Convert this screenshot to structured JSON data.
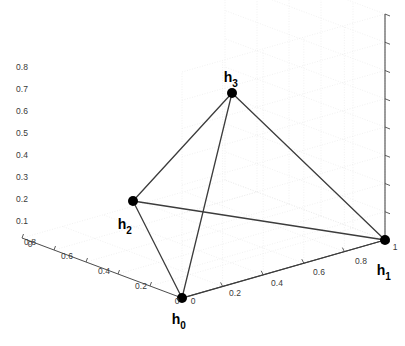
{
  "figure": {
    "background_color": "#ffffff",
    "axis_color": "#4d4d4d",
    "grid_color": "#e8e8e8",
    "edge_color": "#3c3c3c",
    "node_color": "#000000",
    "tick_text_color": "#3a3a3a",
    "label_text_color": "#000000"
  },
  "chart_data": {
    "type": "scatter",
    "title": "",
    "xlabel": "",
    "ylabel": "",
    "zlabel": "",
    "xlim": [
      0,
      1
    ],
    "ylim": [
      0,
      1
    ],
    "zlim": [
      0,
      0.8
    ],
    "grid": true,
    "legend": "none",
    "projection": "3d",
    "axes": [
      {
        "name": "x-axis",
        "orientation": "front-left",
        "ticks": [
          0,
          0.2,
          0.4,
          0.6,
          0.8
        ],
        "tick_labels": [
          "0",
          "0.2",
          "0.4",
          "0.6",
          "0.8"
        ]
      },
      {
        "name": "y-axis",
        "orientation": "front-right",
        "ticks": [
          0,
          0.2,
          0.4,
          0.6,
          0.8,
          1
        ],
        "tick_labels": [
          "0",
          "0.2",
          "0.4",
          "0.6",
          "0.8",
          "1"
        ]
      },
      {
        "name": "z-axis",
        "orientation": "vertical-left",
        "ticks": [
          0,
          0.1,
          0.2,
          0.3,
          0.4,
          0.5,
          0.6,
          0.7,
          0.8
        ],
        "tick_labels": [
          "0",
          "0.1",
          "0.2",
          "0.3",
          "0.4",
          "0.5",
          "0.6",
          "0.7",
          "0.8"
        ]
      }
    ],
    "points": [
      {
        "id": "h0",
        "label": "h",
        "subscript": "0",
        "px": 182,
        "py": 298,
        "label_px": 176,
        "label_py": 324
      },
      {
        "id": "h1",
        "label": "h",
        "subscript": "1",
        "px": 385,
        "py": 240,
        "label_px": 381,
        "label_py": 275
      },
      {
        "id": "h2",
        "label": "h",
        "subscript": "2",
        "px": 133,
        "py": 201,
        "label_px": 122,
        "label_py": 229
      },
      {
        "id": "h3",
        "label": "h",
        "subscript": "3",
        "px": 232,
        "py": 93,
        "label_px": 228,
        "label_py": 82
      }
    ],
    "edges": [
      {
        "from": "h0",
        "to": "h1"
      },
      {
        "from": "h0",
        "to": "h2"
      },
      {
        "from": "h0",
        "to": "h3"
      },
      {
        "from": "h1",
        "to": "h2"
      },
      {
        "from": "h1",
        "to": "h3"
      },
      {
        "from": "h2",
        "to": "h3"
      }
    ],
    "z_tick_labels": [
      {
        "text": "0.8",
        "x": 22,
        "y": 70
      },
      {
        "text": "0.7",
        "x": 22,
        "y": 92
      },
      {
        "text": "0.6",
        "x": 22,
        "y": 114
      },
      {
        "text": "0.5",
        "x": 22,
        "y": 136
      },
      {
        "text": "0.4",
        "x": 22,
        "y": 158
      },
      {
        "text": "0.3",
        "x": 22,
        "y": 180
      },
      {
        "text": "0.2",
        "x": 22,
        "y": 202
      },
      {
        "text": "0.1",
        "x": 22,
        "y": 224
      },
      {
        "text": "0",
        "x": 30,
        "y": 247
      }
    ],
    "x_tick_labels": [
      {
        "text": "0.8",
        "x": 30,
        "y": 245
      },
      {
        "text": "0.6",
        "x": 67,
        "y": 259
      },
      {
        "text": "0.4",
        "x": 104,
        "y": 274
      },
      {
        "text": "0.2",
        "x": 141,
        "y": 289
      },
      {
        "text": "0",
        "x": 177,
        "y": 304
      }
    ],
    "y_tick_labels": [
      {
        "text": "0",
        "x": 193,
        "y": 304
      },
      {
        "text": "0.2",
        "x": 235,
        "y": 296
      },
      {
        "text": "0.4",
        "x": 277,
        "y": 286
      },
      {
        "text": "0.6",
        "x": 319,
        "y": 275
      },
      {
        "text": "0.8",
        "x": 361,
        "y": 264
      },
      {
        "text": "1",
        "x": 395,
        "y": 250
      }
    ]
  }
}
